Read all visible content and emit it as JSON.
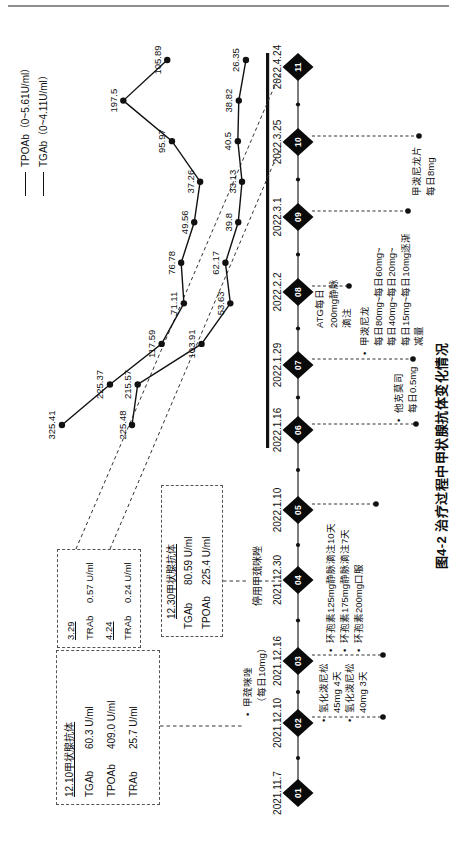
{
  "figure": {
    "caption": "图4-2 治疗过程中甲状腺抗体变化情况"
  },
  "legend": {
    "items": [
      {
        "name": "TPOAb",
        "label": "TPOAb（0~5.61U/ml）"
      },
      {
        "name": "TGAb",
        "label": "TGAb（0~4.11U/ml）"
      }
    ]
  },
  "chart_data": {
    "type": "line",
    "title": "图4-2 治疗过程中甲状腺抗体变化情况",
    "legend_position": "top-right",
    "grid": false,
    "x_timeline": [
      "2021.11.7",
      "2021.12.10",
      "2021.12.16",
      "2021.12.30",
      "2022.1.10",
      "2022.1.16",
      "2022.1.29",
      "2022.2.2",
      "2022.3.1",
      "2022.3.25",
      "2022.4.24"
    ],
    "x_spacing": "even",
    "series": [
      {
        "name": "TPOAb",
        "unit": "U/ml",
        "reference_range": "0~5.61U/ml",
        "values": [
          325.41,
          225.37,
          117.59,
          71.11,
          76.78,
          49.56,
          37.26,
          95.97,
          197.5,
          105.89
        ],
        "labels": [
          "325.41",
          "225.37",
          "117.59",
          "71.11",
          "76.78",
          "49.56",
          "37.26",
          "95.97",
          "197.5",
          "105.89"
        ]
      },
      {
        "name": "TGAb",
        "unit": "U/ml",
        "reference_range": "0~4.11U/ml",
        "values": [
          225.48,
          215.57,
          103.91,
          53.63,
          62.17,
          39.8,
          33.13,
          40.5,
          38.82,
          26.35
        ],
        "labels": [
          "225.48",
          "215.57",
          "103.91",
          "53.63",
          "62.17",
          "39.8",
          "33.13",
          "40.5",
          "38.82",
          "26.35"
        ]
      }
    ]
  },
  "timeline": {
    "nodes": [
      {
        "num": "01",
        "date": "2021.11.7"
      },
      {
        "num": "02",
        "date": "2021.12.10"
      },
      {
        "num": "03",
        "date": "2021.12.16"
      },
      {
        "num": "04",
        "date": "2021.12.30"
      },
      {
        "num": "05",
        "date": "2022.1.10"
      },
      {
        "num": "06",
        "date": "2022.1.16"
      },
      {
        "num": "07",
        "date": "2022.1.29"
      },
      {
        "num": "08",
        "date": "2022.2.2"
      },
      {
        "num": "09",
        "date": "2022.3.1"
      },
      {
        "num": "10",
        "date": "2022.3.25"
      },
      {
        "num": "11",
        "date": "2022.4.24"
      }
    ]
  },
  "callouts": {
    "box1": {
      "title": "12.10甲状腺抗体",
      "rows": [
        {
          "label": "TGAb",
          "value": "60.3 U/ml"
        },
        {
          "label": "TPOAb",
          "value": "409.0 U/ml"
        },
        {
          "label": "TRAb",
          "value": "25.7 U/ml"
        }
      ]
    },
    "box2": {
      "rows": [
        {
          "label": "3.29",
          "value": ""
        },
        {
          "label": "TRAb",
          "value": "0.57 U/ml"
        },
        {
          "label": "4.24",
          "value": ""
        },
        {
          "label": "TRAb",
          "value": "0.24 U/ml"
        }
      ]
    },
    "box3": {
      "title": "12.30甲状腺抗体",
      "rows": [
        {
          "label": "TGAb",
          "value": "80.59 U/ml"
        },
        {
          "label": "TPOAb",
          "value": "225.4 U/ml"
        }
      ]
    },
    "stop_note": "停用甲巯咪唑"
  },
  "medications": [
    {
      "id": "methimazole",
      "lines": [
        "甲巯咪唑",
        "（每日10mg）"
      ],
      "bullet_lines": [
        0
      ]
    },
    {
      "id": "hydroprednisone",
      "lines": [
        "氢化泼尼松",
        "45mg 4天",
        "氢化泼尼松",
        "40mg 3天"
      ],
      "bullet_lines": [
        0,
        2
      ]
    },
    {
      "id": "cyclosporine",
      "lines": [
        "环孢素125mg静脉滴注10天",
        "环孢素175mg静脉滴注7天",
        "环孢素200mg口服"
      ],
      "bullet_lines": [
        0,
        1,
        2
      ]
    },
    {
      "id": "tacrolimus",
      "lines": [
        "他克莫司",
        "每日0.5mg"
      ],
      "bullet_lines": [
        0
      ]
    },
    {
      "id": "atg",
      "lines": [
        "ATG每日",
        "200mg静脉",
        "滴注"
      ],
      "bullet_lines": []
    },
    {
      "id": "methylprednisolone",
      "lines": [
        "甲泼尼龙",
        "每日80mg~每日60mg~",
        "每日40mg~每日20mg~",
        "每日15mg~每日10mg逐渐",
        "减量"
      ],
      "bullet_lines": [
        0
      ]
    },
    {
      "id": "methylprednisolone-tablets",
      "lines": [
        "甲泼尼龙片",
        "每日8mg"
      ],
      "bullet_lines": []
    }
  ]
}
